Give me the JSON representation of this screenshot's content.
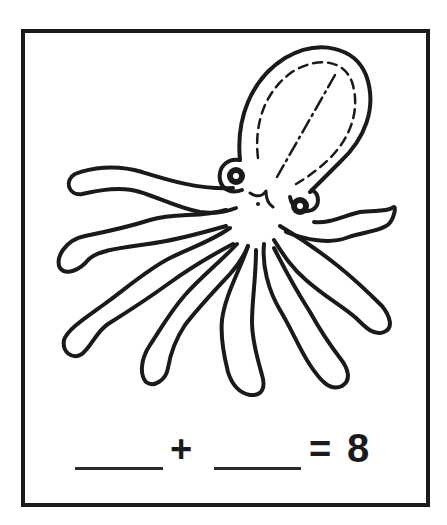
{
  "worksheet": {
    "illustration": "octopus",
    "tentacle_count": 8,
    "equation": {
      "addend1": "",
      "plus_sign": "+",
      "addend2": "",
      "equals_sign": "=",
      "sum": "8"
    }
  },
  "colors": {
    "ink": "#1a1a1a",
    "background": "#ffffff"
  }
}
